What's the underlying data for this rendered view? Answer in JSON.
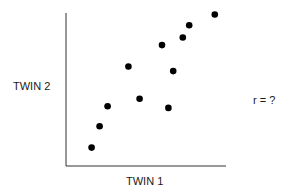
{
  "chart_data": {
    "type": "scatter",
    "title": "",
    "xlabel": "TWIN 1",
    "ylabel": "TWIN 2",
    "annotation": "r = ?",
    "grid": false,
    "ticks": false,
    "xlim": [
      0,
      10
    ],
    "ylim": [
      0,
      10
    ],
    "points": [
      {
        "x": 1.6,
        "y": 1.2
      },
      {
        "x": 2.1,
        "y": 2.6
      },
      {
        "x": 2.6,
        "y": 3.9
      },
      {
        "x": 3.9,
        "y": 6.5
      },
      {
        "x": 4.6,
        "y": 4.4
      },
      {
        "x": 6.0,
        "y": 7.9
      },
      {
        "x": 6.4,
        "y": 3.8
      },
      {
        "x": 6.7,
        "y": 6.2
      },
      {
        "x": 7.3,
        "y": 8.4
      },
      {
        "x": 7.7,
        "y": 9.2
      },
      {
        "x": 9.3,
        "y": 9.9
      }
    ]
  },
  "labels": {
    "x_axis": "TWIN 1",
    "y_axis": "TWIN 2",
    "correlation": "r = ?"
  },
  "colors": {
    "axis": "#333333",
    "point": "#000000"
  }
}
